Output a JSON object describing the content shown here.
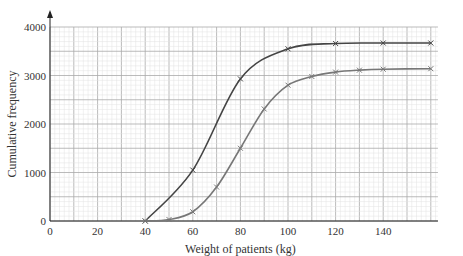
{
  "chart_data": {
    "type": "line",
    "title": "",
    "xlabel": "Weight of patients (kg)",
    "ylabel": "Cumulative frequency",
    "xlim": [
      0,
      165
    ],
    "ylim": [
      0,
      4000
    ],
    "x_ticks": [
      0,
      20,
      40,
      60,
      80,
      100,
      120,
      140
    ],
    "y_ticks": [
      0,
      1000,
      2000,
      3000,
      4000
    ],
    "grid": true,
    "legend": null,
    "series": [
      {
        "name": "Curve A (upper)",
        "color": "#444444",
        "x": [
          40,
          60,
          80,
          100,
          120,
          140,
          160
        ],
        "values": [
          0,
          1050,
          2930,
          3550,
          3660,
          3670,
          3670
        ]
      },
      {
        "name": "Curve B (lower)",
        "color": "#777777",
        "x": [
          40,
          50,
          60,
          70,
          80,
          90,
          100,
          110,
          120,
          130,
          140,
          160
        ],
        "values": [
          0,
          30,
          190,
          700,
          1500,
          2310,
          2800,
          2980,
          3070,
          3110,
          3130,
          3140
        ]
      }
    ]
  }
}
